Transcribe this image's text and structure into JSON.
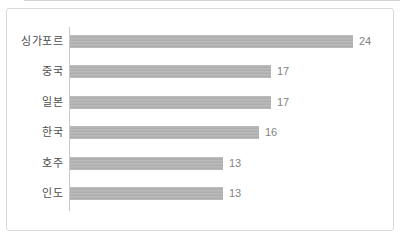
{
  "chart_data": {
    "type": "bar",
    "orientation": "horizontal",
    "title": "",
    "xlabel": "",
    "ylabel": "",
    "categories": [
      "싱가포르",
      "중국",
      "일본",
      "한국",
      "호주",
      "인도"
    ],
    "values": [
      24,
      17,
      17,
      16,
      13,
      13
    ],
    "xlim": [
      0,
      26
    ],
    "grid": false,
    "legend": false,
    "data_labels": true,
    "bar_color": "#b3b3b3",
    "category_label_color": "#4d4d4d",
    "value_label_color": "#7f7f7f",
    "axis_line_color": "#c9c9c9",
    "card_border_color": "#d9d9d9",
    "background_color": "#ffffff"
  }
}
